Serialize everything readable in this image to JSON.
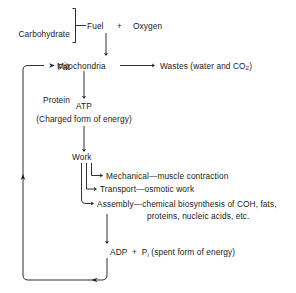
{
  "diagram": {
    "line_color": "#1a1a1a",
    "background_color": "#ffffff",
    "inputs": {
      "bracket_items": [
        "Carbohydrate",
        "Fat",
        "Protein"
      ],
      "fuel_label": "Fuel",
      "plus_sign": "+",
      "oxygen_label": "Oxygen"
    },
    "nodes": {
      "mitochondria": "Mitochondria",
      "wastes": "Wastes (water and CO",
      "wastes_sub": "2",
      "wastes_tail": ")",
      "atp": "ATP",
      "atp_caption": "(Charged form of energy)",
      "work": "Work",
      "adp": "ADP  +  P",
      "adp_sub": "i",
      "adp_caption": " (spent form of energy)"
    },
    "work_branches": [
      {
        "name": "Mechanical",
        "dash": "—",
        "description": "muscle contraction"
      },
      {
        "name": "Transport",
        "dash": "—",
        "description": "osmotic work"
      },
      {
        "name": "Assembly",
        "dash": "—",
        "description": "chemical biosynthesis of COH, fats,"
      }
    ],
    "assembly_second_line": "proteins, nucleic acids, etc."
  }
}
